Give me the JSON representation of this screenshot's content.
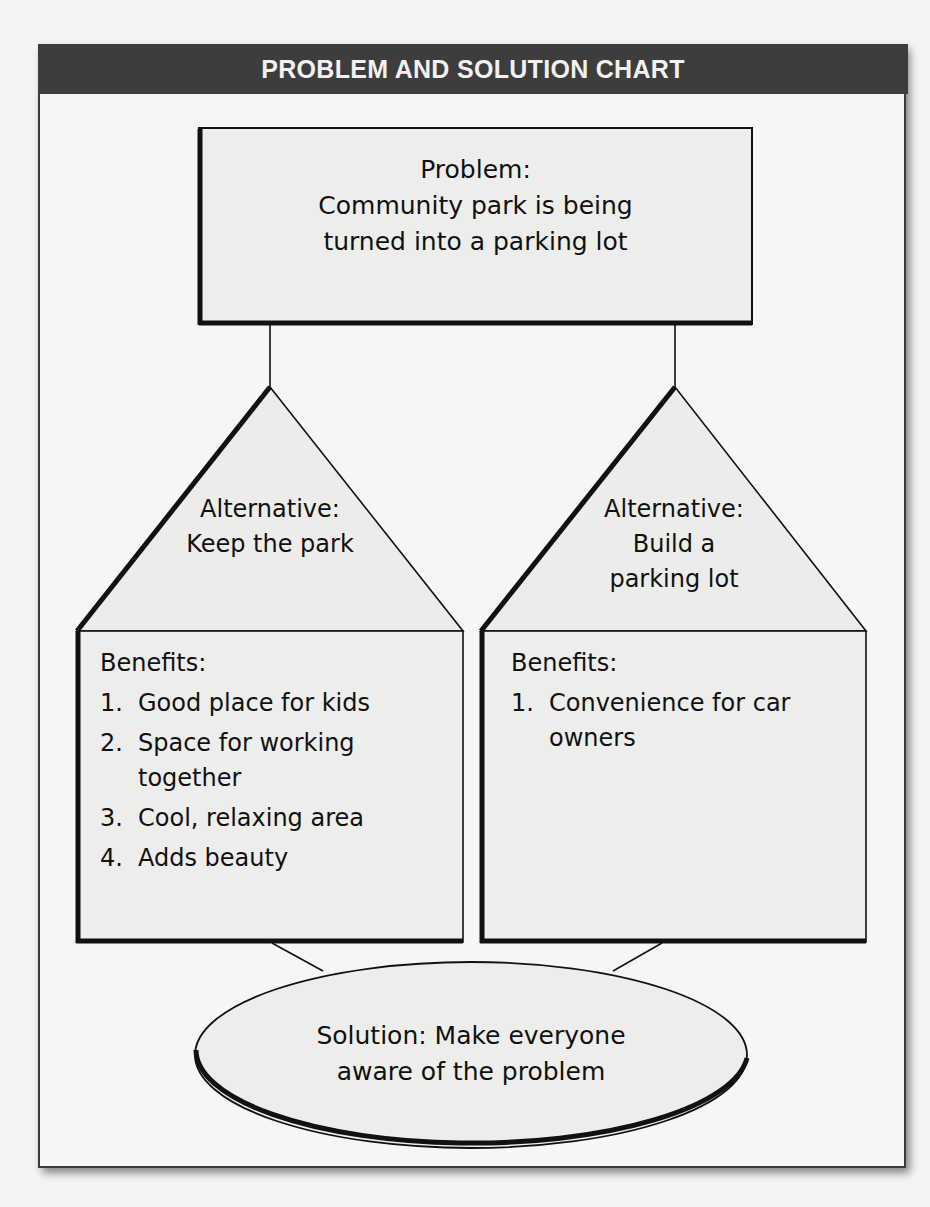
{
  "chart": {
    "title": "PROBLEM AND SOLUTION CHART"
  },
  "problem": {
    "label": "Problem:",
    "text_line1": "Community park is being",
    "text_line2": "turned into a parking lot"
  },
  "alternatives": [
    {
      "label": "Alternative:",
      "text_line1": "Keep the park",
      "text_line2": "",
      "benefits_heading": "Benefits:",
      "benefits": [
        {
          "num": "1.",
          "text": "Good place for kids"
        },
        {
          "num": "2.",
          "text": "Space for working together"
        },
        {
          "num": "3.",
          "text": "Cool, relaxing area"
        },
        {
          "num": "4.",
          "text": "Adds beauty"
        }
      ]
    },
    {
      "label": "Alternative:",
      "text_line1": "Build a",
      "text_line2": "parking lot",
      "benefits_heading": "Benefits:",
      "benefits": [
        {
          "num": "1.",
          "text": "Convenience for car owners"
        }
      ]
    }
  ],
  "solution": {
    "text_line1": "Solution: Make everyone",
    "text_line2": "aware of the problem"
  },
  "colors": {
    "header_bg": "#3d3d3d",
    "header_text": "#f1f1f1",
    "shape_fill": "#ececea",
    "stroke": "#111111",
    "page_bg": "#f4f4f2"
  }
}
